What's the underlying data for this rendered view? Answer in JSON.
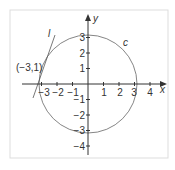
{
  "diagram": {
    "axes": {
      "x_label": "x",
      "y_label": "y",
      "x_ticks": [
        {
          "value": -3,
          "label": "−3"
        },
        {
          "value": -2,
          "label": "−2"
        },
        {
          "value": -1,
          "label": "−1"
        },
        {
          "value": 1,
          "label": "1"
        },
        {
          "value": 2,
          "label": "2"
        },
        {
          "value": 3,
          "label": "3"
        },
        {
          "value": 4,
          "label": "4"
        }
      ],
      "y_ticks": [
        {
          "value": 3,
          "label": "3"
        },
        {
          "value": 2,
          "label": "2"
        },
        {
          "value": 1,
          "label": "1"
        },
        {
          "value": -1,
          "label": "−1"
        },
        {
          "value": -2,
          "label": "−2"
        },
        {
          "value": -3,
          "label": "−3"
        },
        {
          "value": -4,
          "label": "−4"
        }
      ]
    },
    "circle": {
      "label": "c",
      "center": [
        0,
        0
      ],
      "radius_squared": 10
    },
    "tangent_line": {
      "label": "l",
      "point_label": "(−3,1)",
      "point": [
        -3,
        1
      ]
    },
    "colors": {
      "stroke": "#555555",
      "frame": "#dddddd",
      "axis": "#333333"
    }
  }
}
